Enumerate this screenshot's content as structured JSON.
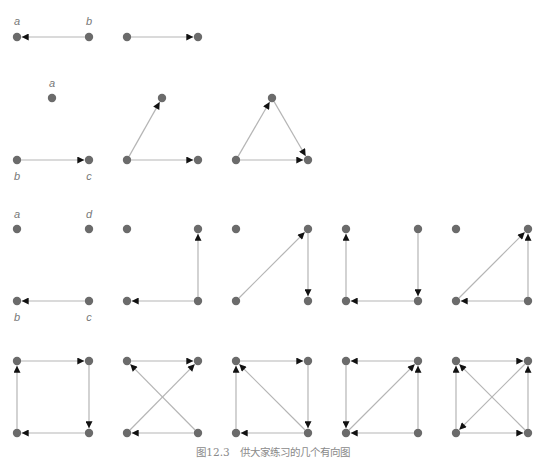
{
  "caption": "图12.3　供大家练习的几个有向图",
  "colors": {
    "node": "#6b6b6b",
    "edge": "#b5b5b5",
    "arrow": "#111111",
    "label": "#777777"
  },
  "graphs": [
    {
      "id": "r1c1",
      "nodes": [
        {
          "x": 17,
          "y": 37,
          "label": "a",
          "lx": 17,
          "ly": 22
        },
        {
          "x": 89,
          "y": 37,
          "label": "b",
          "lx": 89,
          "ly": 22
        }
      ],
      "edges": [
        [
          1,
          0
        ]
      ]
    },
    {
      "id": "r1c2",
      "nodes": [
        {
          "x": 127,
          "y": 37
        },
        {
          "x": 198,
          "y": 37
        }
      ],
      "edges": [
        [
          0,
          1
        ]
      ]
    },
    {
      "id": "r2c1",
      "nodes": [
        {
          "x": 52,
          "y": 98,
          "label": "a",
          "lx": 52,
          "ly": 84
        },
        {
          "x": 17,
          "y": 160,
          "label": "b",
          "lx": 17,
          "ly": 177
        },
        {
          "x": 89,
          "y": 160,
          "label": "c",
          "lx": 89,
          "ly": 177
        }
      ],
      "edges": [
        [
          1,
          2
        ]
      ]
    },
    {
      "id": "r2c2",
      "nodes": [
        {
          "x": 162,
          "y": 98
        },
        {
          "x": 127,
          "y": 160
        },
        {
          "x": 198,
          "y": 160
        }
      ],
      "edges": [
        [
          1,
          0
        ],
        [
          1,
          2
        ]
      ]
    },
    {
      "id": "r2c3",
      "nodes": [
        {
          "x": 272,
          "y": 98
        },
        {
          "x": 236,
          "y": 160
        },
        {
          "x": 308,
          "y": 160
        }
      ],
      "edges": [
        [
          1,
          0
        ],
        [
          0,
          2
        ],
        [
          1,
          2
        ]
      ]
    },
    {
      "id": "r3c1",
      "nodes": [
        {
          "x": 17,
          "y": 229,
          "label": "a",
          "lx": 17,
          "ly": 215
        },
        {
          "x": 89,
          "y": 229,
          "label": "d",
          "lx": 89,
          "ly": 215
        },
        {
          "x": 17,
          "y": 301,
          "label": "b",
          "lx": 17,
          "ly": 318
        },
        {
          "x": 89,
          "y": 301,
          "label": "c",
          "lx": 89,
          "ly": 318
        }
      ],
      "edges": [
        [
          3,
          2
        ]
      ]
    },
    {
      "id": "r3c2",
      "nodes": [
        {
          "x": 127,
          "y": 229
        },
        {
          "x": 198,
          "y": 229
        },
        {
          "x": 127,
          "y": 301
        },
        {
          "x": 198,
          "y": 301
        }
      ],
      "edges": [
        [
          3,
          2
        ],
        [
          3,
          1
        ]
      ]
    },
    {
      "id": "r3c3",
      "nodes": [
        {
          "x": 236,
          "y": 229
        },
        {
          "x": 308,
          "y": 229
        },
        {
          "x": 236,
          "y": 301
        },
        {
          "x": 308,
          "y": 301
        }
      ],
      "edges": [
        [
          2,
          1
        ],
        [
          1,
          3
        ]
      ]
    },
    {
      "id": "r3c4",
      "nodes": [
        {
          "x": 346,
          "y": 229
        },
        {
          "x": 418,
          "y": 229
        },
        {
          "x": 346,
          "y": 301
        },
        {
          "x": 418,
          "y": 301
        }
      ],
      "edges": [
        [
          2,
          0
        ],
        [
          3,
          2
        ],
        [
          1,
          3
        ]
      ]
    },
    {
      "id": "r3c5",
      "nodes": [
        {
          "x": 456,
          "y": 229
        },
        {
          "x": 528,
          "y": 229
        },
        {
          "x": 456,
          "y": 301
        },
        {
          "x": 528,
          "y": 301
        }
      ],
      "edges": [
        [
          2,
          1
        ],
        [
          3,
          2
        ],
        [
          3,
          1
        ]
      ]
    },
    {
      "id": "r4c1",
      "nodes": [
        {
          "x": 17,
          "y": 361
        },
        {
          "x": 89,
          "y": 361
        },
        {
          "x": 17,
          "y": 433
        },
        {
          "x": 89,
          "y": 433
        }
      ],
      "edges": [
        [
          0,
          1
        ],
        [
          1,
          3
        ],
        [
          3,
          2
        ],
        [
          2,
          0
        ]
      ]
    },
    {
      "id": "r4c2",
      "nodes": [
        {
          "x": 127,
          "y": 361
        },
        {
          "x": 198,
          "y": 361
        },
        {
          "x": 127,
          "y": 433
        },
        {
          "x": 198,
          "y": 433
        }
      ],
      "edges": [
        [
          0,
          1
        ],
        [
          3,
          0
        ],
        [
          2,
          1
        ],
        [
          3,
          2
        ]
      ]
    },
    {
      "id": "r4c3",
      "nodes": [
        {
          "x": 236,
          "y": 361
        },
        {
          "x": 308,
          "y": 361
        },
        {
          "x": 236,
          "y": 433
        },
        {
          "x": 308,
          "y": 433
        }
      ],
      "edges": [
        [
          0,
          1
        ],
        [
          1,
          3
        ],
        [
          3,
          2
        ],
        [
          2,
          0
        ],
        [
          3,
          0
        ]
      ]
    },
    {
      "id": "r4c4",
      "nodes": [
        {
          "x": 346,
          "y": 361
        },
        {
          "x": 418,
          "y": 361
        },
        {
          "x": 346,
          "y": 433
        },
        {
          "x": 418,
          "y": 433
        }
      ],
      "edges": [
        [
          1,
          0
        ],
        [
          0,
          2
        ],
        [
          3,
          2
        ],
        [
          3,
          1
        ],
        [
          2,
          1
        ]
      ]
    },
    {
      "id": "r4c5",
      "nodes": [
        {
          "x": 456,
          "y": 361
        },
        {
          "x": 528,
          "y": 361
        },
        {
          "x": 456,
          "y": 433
        },
        {
          "x": 528,
          "y": 433
        }
      ],
      "edges": [
        [
          0,
          1
        ],
        [
          3,
          1
        ],
        [
          2,
          0
        ],
        [
          2,
          3
        ],
        [
          3,
          0
        ],
        [
          1,
          2
        ]
      ]
    }
  ]
}
